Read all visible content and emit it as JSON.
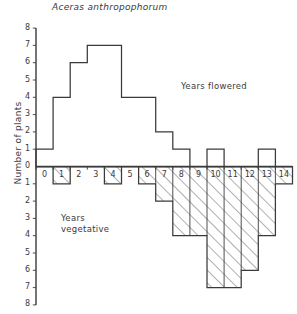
{
  "chart_data": {
    "type": "bar",
    "title": "Aceras anthropophorum",
    "xlabel": "",
    "ylabel": "Number of plants",
    "categories": [
      "0",
      "1",
      "2",
      "3",
      "4",
      "5",
      "6",
      "7",
      "8",
      "9",
      "10",
      "11",
      "12",
      "13",
      "14"
    ],
    "ylim": [
      0,
      8
    ],
    "grid": false,
    "orientation": "back-to-back-histogram",
    "series": [
      {
        "name": "Years flowered",
        "direction": "up",
        "fill": "none",
        "values": [
          1,
          4,
          6,
          7,
          7,
          4,
          4,
          2,
          1,
          0,
          1,
          0,
          0,
          1,
          0
        ]
      },
      {
        "name": "Years vegetative",
        "direction": "down",
        "fill": "diagonal-hatch",
        "values": [
          0,
          1,
          0,
          0,
          1,
          0,
          1,
          2,
          4,
          4,
          7,
          7,
          6,
          4,
          1
        ]
      }
    ],
    "annotations": [
      {
        "text": "Years  flowered",
        "id": "annot-flowered"
      },
      {
        "text": "Years\nvegetative",
        "id": "annot-vegetative"
      }
    ],
    "y_ticks_upper": [
      "8",
      "7",
      "6",
      "5",
      "4",
      "3",
      "2",
      "1",
      "0"
    ],
    "y_ticks_lower": [
      "0",
      "1",
      "2",
      "3",
      "4",
      "5",
      "6",
      "7",
      "8"
    ]
  },
  "axis": {
    "y_title": "Number of plants",
    "upper_ticks": [
      "8",
      "7",
      "6",
      "5",
      "4",
      "3",
      "2",
      "1"
    ],
    "zero_tick": "0",
    "lower_ticks": [
      "1",
      "2",
      "3",
      "4",
      "5",
      "6",
      "7",
      "8"
    ],
    "x_ticks": [
      "0",
      "1",
      "2",
      "3",
      "4",
      "5",
      "6",
      "7",
      "8",
      "9",
      "10",
      "11",
      "12",
      "13",
      "14"
    ]
  },
  "labels": {
    "title": "Aceras anthropophorum",
    "years_flowered": "Years  flowered",
    "years_vegetative_l1": "Years",
    "years_vegetative_l2": "vegetative"
  },
  "style": {
    "line_color": "#3a3a3a",
    "text_color": "#3a3a3a",
    "background": "#ffffff"
  }
}
